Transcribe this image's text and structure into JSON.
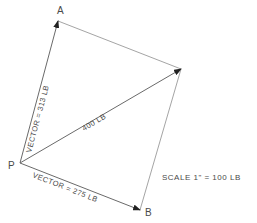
{
  "diagram": {
    "type": "vector-parallelogram",
    "points": {
      "P": {
        "label": "P",
        "x": 20,
        "y": 163
      },
      "A": {
        "label": "A",
        "x": 58,
        "y": 21
      },
      "B": {
        "label": "B",
        "x": 140,
        "y": 210
      },
      "R": {
        "label": "",
        "x": 181,
        "y": 69
      }
    },
    "vectors": {
      "PA": {
        "label": "VECTOR = 313 LB"
      },
      "PB": {
        "label": "VECTOR = 275 LB"
      },
      "PR": {
        "label": "400 LB"
      }
    },
    "scale_note": "SCALE 1\" = 100 LB",
    "colors": {
      "line": "#8a8a8a",
      "arrow": "#222222",
      "text": "#4a4a4a"
    }
  }
}
